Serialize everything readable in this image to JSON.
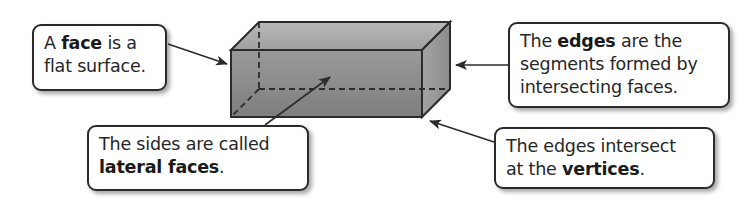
{
  "callouts": {
    "face": {
      "pre": "A ",
      "term": "face",
      "post1": " is a",
      "line2": "flat surface."
    },
    "edges": {
      "pre": "The ",
      "term": "edges",
      "post1": " are the",
      "line2": "segments formed by",
      "line3": "intersecting faces."
    },
    "lateral": {
      "line1": "The sides are called",
      "term": "lateral faces",
      "post": "."
    },
    "vertices": {
      "line1": "The edges intersect",
      "pre": "at the ",
      "term": "vertices",
      "post": "."
    }
  },
  "colors": {
    "prism_fill_light": "#c4c4c4",
    "prism_fill_dark": "#8a8a8a",
    "stroke": "#2b2b2b"
  }
}
